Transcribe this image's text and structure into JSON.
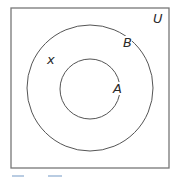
{
  "diagram": {
    "type": "venn",
    "universe": {
      "label": "U",
      "x": 11,
      "y": 8,
      "width": 158,
      "height": 160
    },
    "sets": [
      {
        "id": "B",
        "label": "B",
        "cx": 90,
        "cy": 88,
        "r": 63,
        "label_x": 124,
        "label_y": 47
      },
      {
        "id": "A",
        "label": "A",
        "cx": 90,
        "cy": 89,
        "r": 30,
        "label_x": 113,
        "label_y": 93
      }
    ],
    "elements": [
      {
        "label": "x",
        "x": 47,
        "y": 64,
        "region": "B not A"
      }
    ],
    "relationship": "A is a subset of B",
    "colors": {
      "stroke": "#555555",
      "box": "#777777",
      "text": "#2a2a2a"
    }
  }
}
